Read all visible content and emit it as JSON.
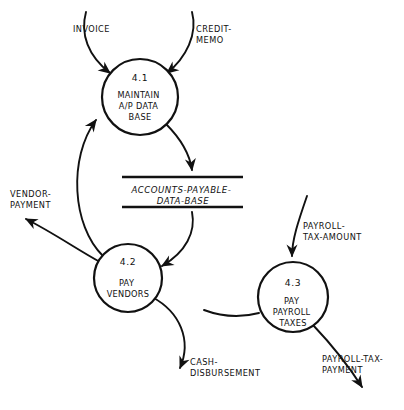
{
  "diagram": {
    "type": "data-flow-diagram",
    "background_color": "#ffffff",
    "ink_color": "#111111"
  },
  "processes": [
    {
      "id": "4.1",
      "number": "4.1",
      "name_lines": [
        "MAINTAIN",
        "A/P DATA",
        "BASE"
      ],
      "cx": 140,
      "cy": 97,
      "r": 38
    },
    {
      "id": "4.2",
      "number": "4.2",
      "name_lines": [
        "PAY",
        "VENDORS"
      ],
      "cx": 128,
      "cy": 278,
      "r": 34
    },
    {
      "id": "4.3",
      "number": "4.3",
      "name_lines": [
        "PAY",
        "PAYROLL",
        "TAXES"
      ],
      "cx": 293,
      "cy": 297,
      "r": 35
    }
  ],
  "data_stores": [
    {
      "id": "accounts-payable-data-base",
      "name_lines": [
        "ACCOUNTS-PAYABLE-",
        "DATA-BASE"
      ],
      "x_left": 122,
      "x_right": 243,
      "y_top": 176,
      "y_bottom": 208
    }
  ],
  "flows": [
    {
      "id": "invoice",
      "label_lines": [
        "INVOICE"
      ],
      "label_x": 97,
      "label_y": 29,
      "anchor": "middle",
      "from": "external",
      "to": "4.1"
    },
    {
      "id": "credit-memo",
      "label_lines": [
        "CREDIT-",
        "MEMO"
      ],
      "label_x": 213,
      "label_y": 29,
      "anchor": "start",
      "from": "external",
      "to": "4.1"
    },
    {
      "id": "vendor-payment",
      "label_lines": [
        "VENDOR-",
        "PAYMENT"
      ],
      "label_x": 8,
      "label_y": 194,
      "anchor": "start",
      "from": "4.2",
      "to": "external"
    },
    {
      "id": "payroll-tax-amount",
      "label_lines": [
        "PAYROLL-",
        "TAX-AMOUNT"
      ],
      "label_x": 307,
      "label_y": 225,
      "anchor": "start",
      "from": "external",
      "to": "4.3"
    },
    {
      "id": "cash-disbursement",
      "label_lines": [
        "CASH-",
        "DISBURSEMENT"
      ],
      "label_x": 188,
      "label_y": 362,
      "anchor": "start",
      "from": "4.2",
      "to": "external"
    },
    {
      "id": "payroll-tax-payment",
      "label_lines": [
        "PAYROLL-TAX-",
        "PAYMENT"
      ],
      "label_x": 325,
      "label_y": 359,
      "anchor": "start",
      "from": "4.3",
      "to": "external"
    },
    {
      "id": "ap-update",
      "label_lines": [],
      "from": "4.1",
      "to": "accounts-payable-data-base"
    },
    {
      "id": "ap-read",
      "label_lines": [],
      "from": "accounts-payable-data-base",
      "to": "4.2"
    },
    {
      "id": "vendor-feedback",
      "label_lines": [],
      "from": "4.2",
      "to": "4.1"
    }
  ]
}
